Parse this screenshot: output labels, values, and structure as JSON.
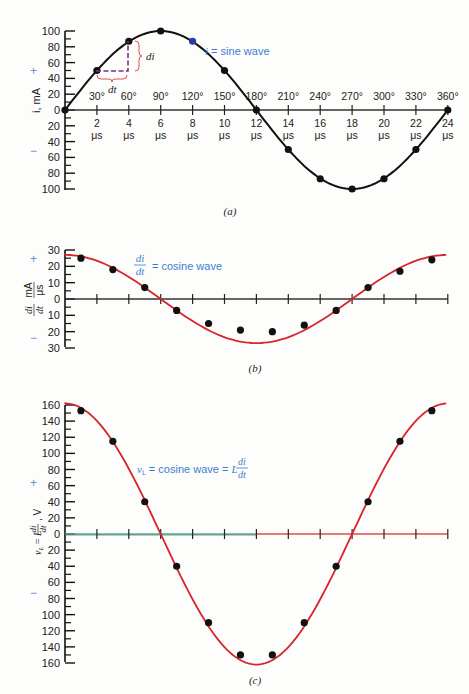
{
  "chart_data": [
    {
      "id": "a",
      "type": "line",
      "caption": "(a)",
      "title": "",
      "ylabel": "i, mA",
      "xlabel": "",
      "ylim": [
        -100,
        100
      ],
      "y_ticks": [
        100,
        80,
        60,
        40,
        20,
        0,
        20,
        40,
        60,
        80,
        100
      ],
      "x_us_ticks": [
        "2",
        "4",
        "6",
        "8",
        "10",
        "12",
        "14",
        "16",
        "18",
        "20",
        "22",
        "24"
      ],
      "x_unit": "μs",
      "x_deg_ticks": [
        "30°",
        "60°",
        "90°",
        "120°",
        "150°",
        "180°",
        "210°",
        "240°",
        "270°",
        "300°",
        "330°",
        "360°"
      ],
      "series": [
        {
          "name": "i = sine wave",
          "color": "#111111",
          "x_us": [
            0,
            2,
            4,
            6,
            8,
            10,
            12,
            14,
            16,
            18,
            20,
            22,
            24
          ],
          "values": [
            0,
            50,
            87,
            100,
            87,
            50,
            0,
            -50,
            -87,
            -100,
            -87,
            -50,
            0
          ]
        }
      ],
      "highlight_point": {
        "x_us": 8,
        "value": 87,
        "color": "#2a3aa0"
      },
      "annotations": {
        "curve_label_var": "i",
        "curve_label_rest": " = sine wave",
        "dt_label": "dt",
        "di_label": "di"
      },
      "sign_plus": "+",
      "sign_minus": "−"
    },
    {
      "id": "b",
      "type": "line",
      "caption": "(b)",
      "ylabel_num": "di",
      "ylabel_den": "dt",
      "ylabel_unit_num": "mA",
      "ylabel_unit_den": "μs",
      "ylim": [
        -30,
        30
      ],
      "y_ticks": [
        30,
        20,
        10,
        0,
        10,
        20,
        30
      ],
      "series": [
        {
          "name": "di/dt = cosine wave",
          "color": "#d8242c",
          "point_color": "#111111",
          "x_us": [
            1,
            3,
            5,
            7,
            9,
            11,
            13,
            15,
            17,
            19,
            21,
            23
          ],
          "values": [
            25,
            18,
            7,
            -7,
            -15,
            -19,
            -20,
            -16,
            -7,
            7,
            17,
            24
          ]
        }
      ],
      "annotations": {
        "frac_num": "di",
        "frac_den": "dt",
        "label_rest": "= cosine wave"
      },
      "sign_plus": "+",
      "sign_minus": "−"
    },
    {
      "id": "c",
      "type": "line",
      "caption": "(c)",
      "ylabel": "vL = L di/dt, V",
      "ylim": [
        -160,
        160
      ],
      "y_ticks": [
        160,
        140,
        120,
        100,
        80,
        60,
        40,
        20,
        0,
        20,
        40,
        60,
        80,
        100,
        120,
        140,
        160
      ],
      "series": [
        {
          "name": "vL = cosine wave = L di/dt",
          "color": "#d8242c",
          "point_color": "#111111",
          "x_us": [
            1,
            3,
            5,
            7,
            9,
            11,
            13,
            15,
            17,
            19,
            21,
            23
          ],
          "values": [
            153,
            115,
            40,
            -40,
            -110,
            -150,
            -150,
            -110,
            -40,
            40,
            115,
            153
          ]
        }
      ],
      "annotations": {
        "label_var": "v",
        "label_sub": "L",
        "label_rest": " = cosine wave = ",
        "label_L": "L",
        "frac_num": "di",
        "frac_den": "dt"
      },
      "sign_plus": "+",
      "sign_minus": "−"
    }
  ]
}
